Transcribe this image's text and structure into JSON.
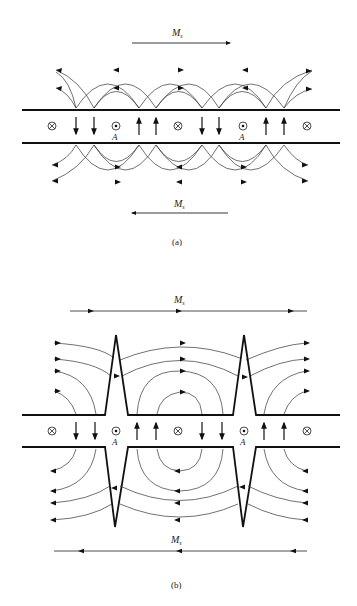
{
  "figure": {
    "panel_a": {
      "caption": "(a)",
      "top_magnetization": {
        "label": "M",
        "subscript": "s",
        "direction": "right"
      },
      "bottom_magnetization": {
        "label": "M",
        "subscript": "s",
        "direction": "left"
      },
      "film_symbols": [
        "⊗",
        "↓",
        "↓",
        "⊙",
        "↑",
        "↑",
        "⊗",
        "↓",
        "↓",
        "⊙",
        "↑",
        "↑",
        "⊗"
      ],
      "wall_labels": [
        "A",
        "A"
      ]
    },
    "panel_b": {
      "caption": "(b)",
      "top_magnetization": {
        "label": "M",
        "subscript": "s",
        "direction": "right"
      },
      "bottom_magnetization": {
        "label": "M",
        "subscript": "s",
        "direction": "left"
      },
      "film_symbols": [
        "⊗",
        "↓",
        "↓",
        "⊙",
        "↑",
        "↑",
        "⊗",
        "↓",
        "↓",
        "⊙",
        "↑",
        "↑",
        "⊗"
      ],
      "wall_labels": [
        "A",
        "A"
      ]
    }
  }
}
